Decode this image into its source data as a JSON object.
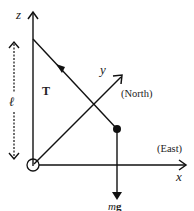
{
  "diagram": {
    "axes": {
      "z": {
        "label": "z"
      },
      "y": {
        "label": "y",
        "direction": "(North)"
      },
      "x": {
        "label": "x",
        "direction": "(East)"
      }
    },
    "length_label": "ℓ",
    "tension_label": "T",
    "weight_label": "mg",
    "weight_label_m": "m",
    "weight_label_g": "g",
    "colors": {
      "stroke": "#111111",
      "background": "#ffffff"
    }
  }
}
